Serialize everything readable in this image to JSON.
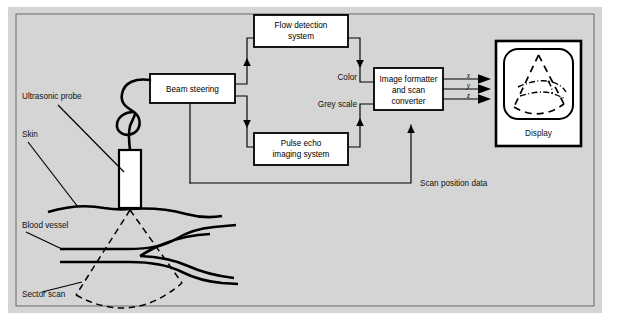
{
  "figure": {
    "background_color": "#d4d4d4",
    "paper_color": "#ffffff",
    "line_color": "#000000"
  },
  "blocks": [
    {
      "id": "beam-steering",
      "label_line1": "Beam steering",
      "label_line2": "",
      "label_line3": ""
    },
    {
      "id": "flow-detection",
      "label_line1": "Flow detection",
      "label_line2": "system",
      "label_line3": ""
    },
    {
      "id": "pulse-echo",
      "label_line1": "Pulse echo",
      "label_line2": "imaging system",
      "label_line3": ""
    },
    {
      "id": "image-formatter",
      "label_line1": "Image formatter",
      "label_line2": "and scan",
      "label_line3": "converter"
    }
  ],
  "signal_labels": {
    "color": "Color",
    "grey_scale": "Grey scale",
    "scan_position_data": "Scan position data"
  },
  "axis_outputs": [
    {
      "name": "x-output",
      "label": "x"
    },
    {
      "name": "y-output",
      "label": "y"
    },
    {
      "name": "z-output",
      "label": "z"
    }
  ],
  "display": {
    "caption": "Display"
  },
  "anatomy_labels": [
    {
      "id": "ultrasonic-probe",
      "text": "Ultrasonic probe"
    },
    {
      "id": "skin",
      "text": "Skin"
    },
    {
      "id": "blood-vessel",
      "text": "Blood vessel"
    },
    {
      "id": "sector-scan",
      "text": "Sector scan"
    }
  ]
}
